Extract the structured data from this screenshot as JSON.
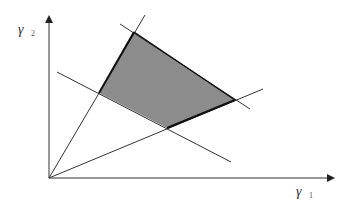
{
  "diagram": {
    "axes": {
      "x_label": "γ",
      "x_subscript": "1",
      "y_label": "γ",
      "y_subscript": "2",
      "origin": [
        49,
        178
      ],
      "x_end": [
        335,
        178
      ],
      "y_end": [
        49,
        15
      ]
    },
    "feasible_region": {
      "fill": "#8c8c8c",
      "vertices": [
        [
          134,
          32
        ],
        [
          235,
          100
        ],
        [
          167,
          128
        ],
        [
          99,
          93
        ]
      ]
    },
    "lines": [
      {
        "name": "ray-upper",
        "from": [
          49,
          178
        ],
        "to": [
          145,
          15
        ]
      },
      {
        "name": "ray-lower",
        "from": [
          49,
          178
        ],
        "to": [
          263,
          89
        ]
      },
      {
        "name": "line-lower-bound",
        "from": [
          57,
          72
        ],
        "to": [
          231,
          162
        ]
      },
      {
        "name": "line-upper-bound",
        "from": [
          120,
          24
        ],
        "to": [
          250,
          109
        ]
      }
    ],
    "colors": {
      "line": "#333333",
      "edge_bold": "#111111",
      "axis": "#333333"
    }
  }
}
